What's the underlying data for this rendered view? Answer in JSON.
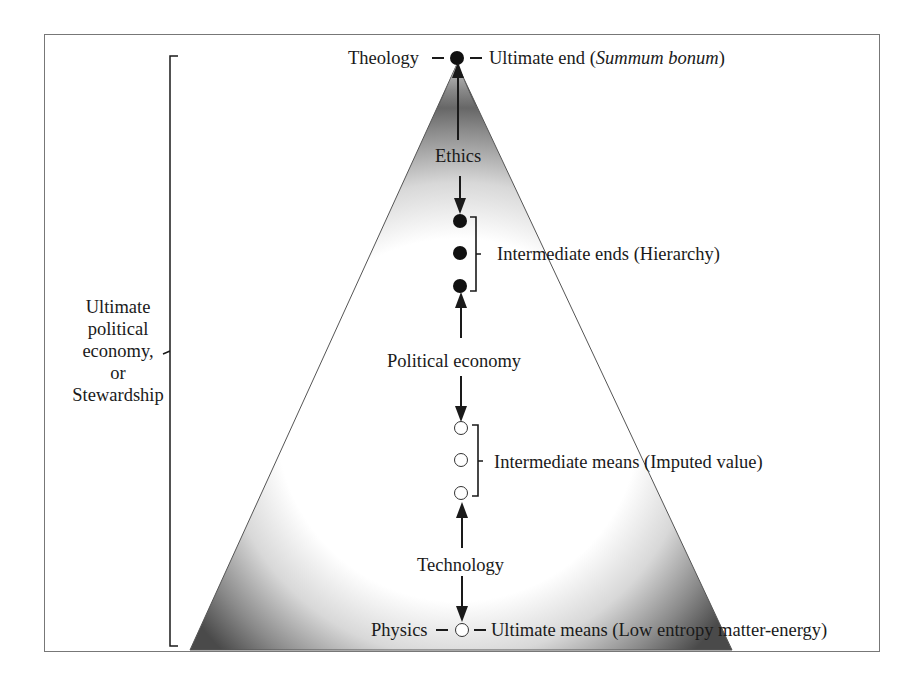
{
  "diagram": {
    "type": "pyramid-hierarchy",
    "side_label": {
      "lines": [
        "Ultimate",
        "political",
        "economy,",
        "or",
        "Stewardship"
      ]
    },
    "apex": {
      "discipline": "Theology",
      "description_prefix": "Ultimate end (",
      "description_italic": "Summum bonum",
      "description_suffix": ")",
      "node_style": "filled"
    },
    "links": [
      {
        "label": "Ethics",
        "from": "apex",
        "to": "intermediate_ends"
      },
      {
        "label": "Political economy",
        "from": "intermediate_ends",
        "to": "intermediate_means"
      },
      {
        "label": "Technology",
        "from": "intermediate_means",
        "to": "base"
      }
    ],
    "intermediate_ends": {
      "label": "Intermediate ends (Hierarchy)",
      "node_count": 3,
      "node_style": "filled"
    },
    "intermediate_means": {
      "label": "Intermediate means (Imputed value)",
      "node_count": 3,
      "node_style": "hollow"
    },
    "base": {
      "discipline": "Physics",
      "description": "Ultimate means (Low entropy matter-energy)",
      "node_style": "hollow"
    },
    "colors": {
      "ink": "#1a1a1a",
      "frame": "#777777",
      "pyramid_shade": "#555555"
    }
  }
}
